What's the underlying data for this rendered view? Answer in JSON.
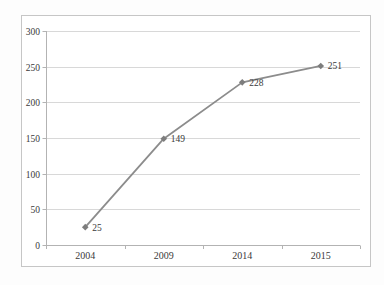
{
  "chart_data": {
    "type": "line",
    "categories": [
      "2004",
      "2009",
      "2014",
      "2015"
    ],
    "series": [
      {
        "name": "Series 1",
        "values": [
          25,
          149,
          228,
          251
        ]
      }
    ],
    "data_labels": [
      "25",
      "149",
      "228",
      "251"
    ],
    "title": "",
    "xlabel": "",
    "ylabel": "",
    "ylim": [
      0,
      300
    ],
    "yticks": [
      0,
      50,
      100,
      150,
      200,
      250,
      300
    ],
    "grid": "horizontal",
    "legend": "none",
    "marker": "diamond",
    "colors": {
      "line": "#8c8c8c",
      "marker": "#7d7d7d",
      "gridline": "#d8d8d8",
      "axis": "#b3b3b3",
      "tick": "#b3b3b3",
      "text": "#3a3a3a",
      "figure_border": "#c6c6c6",
      "plot_background": "#ffffff",
      "figure_background": "#ffffff"
    }
  }
}
